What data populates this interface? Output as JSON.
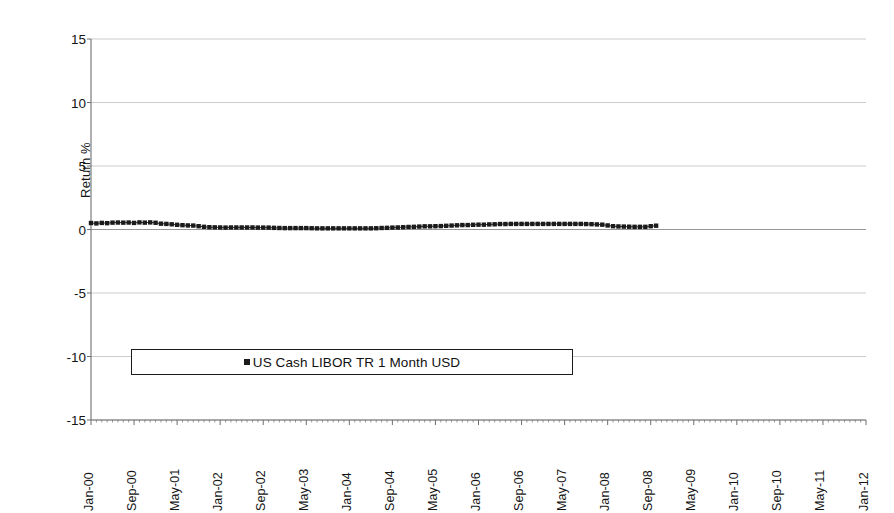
{
  "chart_data": {
    "type": "line",
    "title": "",
    "xlabel": "",
    "ylabel": "Return %",
    "ylim": [
      -15,
      15
    ],
    "yticks": [
      15,
      10,
      5,
      0,
      -5,
      -10,
      -15
    ],
    "grid": true,
    "legend_position": "inside-lower-left",
    "legend": [
      "US Cash LIBOR TR 1 Month USD"
    ],
    "marker": "square",
    "marker_color": "#1b1b1b",
    "x_tick_labels": [
      "Jan-00",
      "Sep-00",
      "May-01",
      "Jan-02",
      "Sep-02",
      "May-03",
      "Jan-04",
      "Sep-04",
      "May-05",
      "Jan-06",
      "Sep-06",
      "May-07",
      "Jan-08",
      "Sep-08",
      "May-09",
      "Jan-10",
      "Sep-10",
      "May-11",
      "Jan-12"
    ],
    "x_tick_interval_months": 8,
    "x_range": [
      "Jan-00",
      "Jan-12"
    ],
    "series": [
      {
        "name": "US Cash LIBOR TR 1 Month USD",
        "start": "Jan-00",
        "end": "Oct-08",
        "x": [
          "Jan-00",
          "Feb-00",
          "Mar-00",
          "Apr-00",
          "May-00",
          "Jun-00",
          "Jul-00",
          "Aug-00",
          "Sep-00",
          "Oct-00",
          "Nov-00",
          "Dec-00",
          "Jan-01",
          "Feb-01",
          "Mar-01",
          "Apr-01",
          "May-01",
          "Jun-01",
          "Jul-01",
          "Aug-01",
          "Sep-01",
          "Oct-01",
          "Nov-01",
          "Dec-01",
          "Jan-02",
          "Feb-02",
          "Mar-02",
          "Apr-02",
          "May-02",
          "Jun-02",
          "Jul-02",
          "Aug-02",
          "Sep-02",
          "Oct-02",
          "Nov-02",
          "Dec-02",
          "Jan-03",
          "Feb-03",
          "Mar-03",
          "Apr-03",
          "May-03",
          "Jun-03",
          "Jul-03",
          "Aug-03",
          "Sep-03",
          "Oct-03",
          "Nov-03",
          "Dec-03",
          "Jan-04",
          "Feb-04",
          "Mar-04",
          "Apr-04",
          "May-04",
          "Jun-04",
          "Jul-04",
          "Aug-04",
          "Sep-04",
          "Oct-04",
          "Nov-04",
          "Dec-04",
          "Jan-05",
          "Feb-05",
          "Mar-05",
          "Apr-05",
          "May-05",
          "Jun-05",
          "Jul-05",
          "Aug-05",
          "Sep-05",
          "Oct-05",
          "Nov-05",
          "Dec-05",
          "Jan-06",
          "Feb-06",
          "Mar-06",
          "Apr-06",
          "May-06",
          "Jun-06",
          "Jul-06",
          "Aug-06",
          "Sep-06",
          "Oct-06",
          "Nov-06",
          "Dec-06",
          "Jan-07",
          "Feb-07",
          "Mar-07",
          "Apr-07",
          "May-07",
          "Jun-07",
          "Jul-07",
          "Aug-07",
          "Sep-07",
          "Oct-07",
          "Nov-07",
          "Dec-07",
          "Jan-08",
          "Feb-08",
          "Mar-08",
          "Apr-08",
          "May-08",
          "Jun-08",
          "Jul-08",
          "Aug-08",
          "Sep-08",
          "Oct-08"
        ],
        "values": [
          0.51,
          0.48,
          0.52,
          0.5,
          0.54,
          0.55,
          0.54,
          0.55,
          0.52,
          0.56,
          0.54,
          0.56,
          0.53,
          0.46,
          0.44,
          0.41,
          0.37,
          0.34,
          0.32,
          0.31,
          0.26,
          0.21,
          0.18,
          0.17,
          0.16,
          0.15,
          0.16,
          0.16,
          0.16,
          0.16,
          0.16,
          0.15,
          0.15,
          0.15,
          0.13,
          0.12,
          0.11,
          0.11,
          0.11,
          0.11,
          0.11,
          0.1,
          0.09,
          0.09,
          0.09,
          0.09,
          0.09,
          0.09,
          0.09,
          0.09,
          0.09,
          0.09,
          0.09,
          0.1,
          0.12,
          0.13,
          0.15,
          0.16,
          0.18,
          0.2,
          0.21,
          0.23,
          0.25,
          0.25,
          0.26,
          0.27,
          0.29,
          0.31,
          0.33,
          0.35,
          0.35,
          0.37,
          0.38,
          0.38,
          0.4,
          0.41,
          0.43,
          0.43,
          0.44,
          0.44,
          0.44,
          0.44,
          0.44,
          0.44,
          0.44,
          0.44,
          0.44,
          0.44,
          0.44,
          0.44,
          0.44,
          0.44,
          0.43,
          0.42,
          0.4,
          0.38,
          0.32,
          0.26,
          0.24,
          0.23,
          0.22,
          0.21,
          0.21,
          0.21,
          0.26,
          0.3
        ]
      }
    ]
  },
  "plot_geometry": {
    "left": 91,
    "right": 866,
    "top": 39,
    "bottom": 420
  },
  "legend": {
    "label": "US Cash LIBOR TR 1 Month USD"
  },
  "axis": {
    "y_title": "Return %"
  }
}
